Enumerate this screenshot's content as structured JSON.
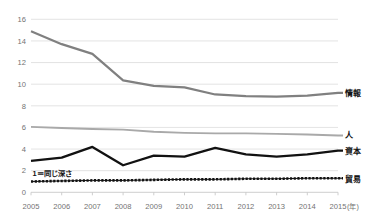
{
  "chart_data": {
    "type": "line",
    "title": "",
    "xlabel": "",
    "ylabel": "",
    "x_unit_label": "(年)",
    "categories": [
      "2005",
      "2006",
      "2007",
      "2008",
      "2009",
      "2010",
      "2011",
      "2012",
      "2013",
      "2014",
      "2015"
    ],
    "ylim": [
      0,
      16
    ],
    "yticks": [
      0,
      2,
      4,
      6,
      8,
      10,
      12,
      14,
      16
    ],
    "ytick_labels": [
      "0",
      "2",
      "4",
      "6",
      "8",
      "10",
      "12",
      "14",
      "16"
    ],
    "grid": true,
    "legend_position": "right-end-of-line",
    "annotations": [
      {
        "text": "1＝同じ深さ",
        "x": "2005",
        "y": 1.55
      }
    ],
    "series": [
      {
        "name": "情報",
        "color": "#808080",
        "style": "solid",
        "width": 2.2,
        "label_y": 9.2,
        "values": [
          14.9,
          13.7,
          12.8,
          10.35,
          9.85,
          9.7,
          9.05,
          8.9,
          8.85,
          8.95,
          9.2
        ]
      },
      {
        "name": "人",
        "color": "#a9a9a9",
        "style": "solid",
        "width": 1.9,
        "label_y": 5.3,
        "values": [
          6.05,
          5.95,
          5.85,
          5.8,
          5.6,
          5.5,
          5.45,
          5.45,
          5.4,
          5.35,
          5.25
        ]
      },
      {
        "name": "資本",
        "color": "#121212",
        "style": "solid",
        "width": 2.3,
        "label_y": 3.85,
        "values": [
          2.9,
          3.2,
          4.2,
          2.5,
          3.4,
          3.3,
          4.1,
          3.5,
          3.3,
          3.5,
          3.85
        ]
      },
      {
        "name": "貿易",
        "color": "#121212",
        "style": "dotted",
        "width": 2.6,
        "label_y": 1.25,
        "values": [
          1.0,
          1.05,
          1.1,
          1.1,
          1.15,
          1.2,
          1.2,
          1.25,
          1.25,
          1.3,
          1.3
        ]
      }
    ]
  },
  "geometry": {
    "plot_left": 31,
    "plot_right": 338,
    "plot_top": 19.3,
    "plot_bottom": 192.3,
    "label_x": 345,
    "line_overhang": 5,
    "xlabel_baseline": 209,
    "unit_x": 347
  }
}
